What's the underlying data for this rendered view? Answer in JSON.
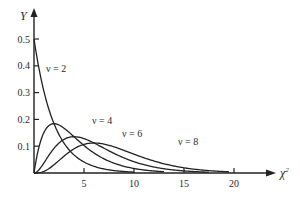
{
  "chart_data": {
    "type": "line",
    "title": "",
    "xlabel": "χ²",
    "ylabel": "Y",
    "xlim": [
      0,
      23
    ],
    "ylim": [
      0,
      0.55
    ],
    "x_ticks": [
      5,
      10,
      15,
      20
    ],
    "x_tick_labels": [
      "5",
      "10",
      "15",
      "20"
    ],
    "y_ticks": [
      0.1,
      0.2,
      0.3,
      0.4,
      0.5
    ],
    "y_tick_labels": [
      "0.1",
      "0.2",
      "0.3",
      "0.4",
      "0.5"
    ],
    "grid": false,
    "legend": "inline labels on curves",
    "series": [
      {
        "name": "ν = 2",
        "df": 2,
        "x_range": [
          0,
          10
        ],
        "peak": {
          "x": 0,
          "y": 0.5
        }
      },
      {
        "name": "ν = 4",
        "df": 4,
        "x_range": [
          0,
          13
        ],
        "peak": {
          "x": 2,
          "y": 0.184
        }
      },
      {
        "name": "ν = 6",
        "df": 6,
        "x_range": [
          0,
          17.5
        ],
        "peak": {
          "x": 4,
          "y": 0.135
        }
      },
      {
        "name": "ν = 8",
        "df": 8,
        "x_range": [
          0,
          19.5
        ],
        "peak": {
          "x": 6,
          "y": 0.112
        }
      }
    ]
  },
  "labels": {
    "y_axis": "Y",
    "x_axis": "χ",
    "x_axis_sup": "2",
    "curves": [
      "ν = 2",
      "ν = 4",
      "ν = 6",
      "ν = 8"
    ]
  }
}
